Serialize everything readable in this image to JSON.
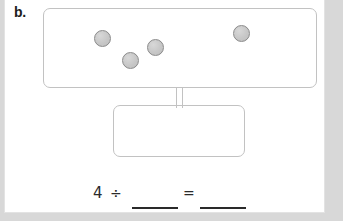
{
  "worksheet": {
    "problem_label": "b.",
    "background_color": "#d8d8d8",
    "paper_color": "#ffffff"
  },
  "set_box": {
    "name": "total-set-box",
    "border_color": "#c2c2c2",
    "counter_count": 4,
    "counter_color": "#c7c7c7",
    "counter_outline_color": "#8a8a8a",
    "counters": [
      {
        "id": "counter-1",
        "x": 50,
        "y": 21
      },
      {
        "id": "counter-2",
        "x": 78,
        "y": 43
      },
      {
        "id": "counter-3",
        "x": 103,
        "y": 30
      },
      {
        "id": "counter-4",
        "x": 189,
        "y": 16
      }
    ]
  },
  "group_box": {
    "name": "equal-group-box",
    "border_color": "#c2c2c2",
    "contents": ""
  },
  "connectors": {
    "left_stem": "branch-left",
    "right_stem": "branch-right"
  },
  "equation": {
    "dividend": "4",
    "divide_symbol": "÷",
    "equals_symbol": "=",
    "divisor_answer": "",
    "quotient_answer": "",
    "divisor_placeholder": "",
    "quotient_placeholder": ""
  }
}
